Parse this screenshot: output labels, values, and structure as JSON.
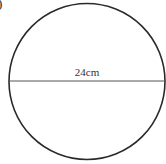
{
  "figure": {
    "part_label": ")",
    "shape": "circle",
    "diameter_label": "24cm",
    "stroke_color": "#2a2a2a",
    "line_color": "#555555"
  }
}
